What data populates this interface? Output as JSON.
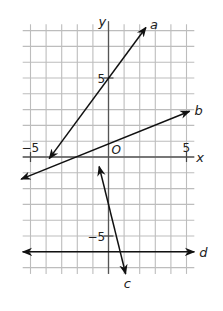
{
  "chart_data": {
    "type": "line",
    "title": "",
    "xlabel": "x",
    "ylabel": "y",
    "origin_label": "O",
    "xlim": [
      -5,
      5
    ],
    "ylim": [
      -7,
      8
    ],
    "grid": true,
    "tick_labels": {
      "x": [
        {
          "value": -5,
          "label": "-5"
        },
        {
          "value": 5,
          "label": "5"
        }
      ],
      "y": [
        {
          "value": 5,
          "label": "5"
        },
        {
          "value": -5,
          "label": "-5"
        }
      ]
    },
    "series": [
      {
        "name": "a",
        "label": "a",
        "equation": "y = (4/3)x + 5",
        "slope": 1.333,
        "intercept": 5,
        "from": [
          -3.8,
          -0.1
        ],
        "to": [
          2.4,
          8.2
        ],
        "arrows": "both"
      },
      {
        "name": "b",
        "label": "b",
        "equation": "y = 0.4x + 0.8",
        "slope": 0.4,
        "intercept": 0.8,
        "from": [
          -5.6,
          -1.4
        ],
        "to": [
          5.2,
          2.9
        ],
        "arrows": "both"
      },
      {
        "name": "c",
        "label": "c",
        "equation": "y = -4x - 3",
        "slope": -4,
        "intercept": -3,
        "from": [
          -0.6,
          -0.6
        ],
        "to": [
          1.1,
          -7.4
        ],
        "arrows": "both"
      },
      {
        "name": "d",
        "label": "d",
        "equation": "y = -6",
        "slope": 0,
        "intercept": -6,
        "from": [
          -5.5,
          -6
        ],
        "to": [
          5.5,
          -6
        ],
        "arrows": "both"
      }
    ]
  }
}
